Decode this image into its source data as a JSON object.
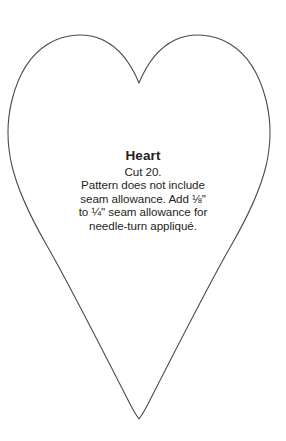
{
  "document": {
    "kind": "sewing-pattern-template",
    "background_color": "#ffffff"
  },
  "shape": {
    "name": "heart",
    "outline_color": "#4a4a4a",
    "fill_color": "#ffffff",
    "stroke_width": "1.1"
  },
  "label": {
    "title": "Heart",
    "lines": [
      "Cut 20.",
      "Pattern does not include",
      "seam allowance. Add ⅛\"",
      "to ¼\" seam allowance for",
      "needle-turn appliqué."
    ]
  }
}
